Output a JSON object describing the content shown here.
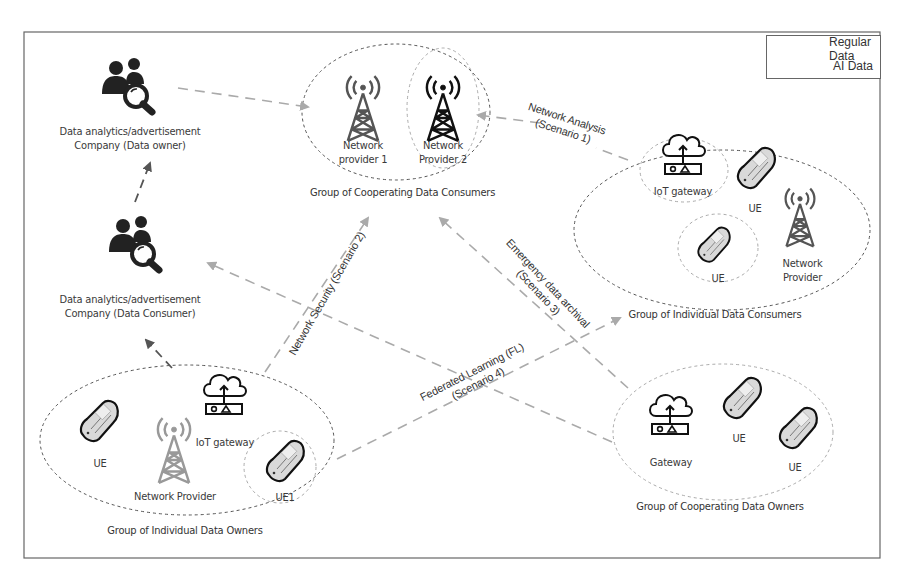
{
  "legend": {
    "items": [
      {
        "label": "Regular Data",
        "color": "#555555"
      },
      {
        "label": "AI Data",
        "color": "#aaaaaa"
      }
    ]
  },
  "nodes": {
    "company_owner": {
      "line1": "Data analytics/advertisement",
      "line2": "Company  (Data owner)",
      "icon": "people-search-icon"
    },
    "company_consumer": {
      "line1": "Data analytics/advertisement",
      "line2": "Company  (Data Consumer)",
      "icon": "people-search-icon"
    },
    "cooperating_consumers": {
      "group_label": "Group of Cooperating Data Consumers",
      "provider1": {
        "line1": "Network",
        "line2": "provider 1"
      },
      "provider2": {
        "line1": "Network",
        "line2": "Provider 2"
      }
    },
    "individual_consumers": {
      "group_label": "Group of Individual Data Consumers",
      "gateway": "IoT gateway",
      "ue1": "UE",
      "ue2": "UE",
      "provider": {
        "line1": "Network",
        "line2": "Provider"
      }
    },
    "individual_owners": {
      "group_label": "Group of Individual Data Owners",
      "ue": "UE",
      "provider": "Network Provider",
      "gateway": "IoT gateway",
      "ue1": "UE1"
    },
    "cooperating_owners": {
      "group_label": "Group of Cooperating Data Owners",
      "gateway": "Gateway",
      "ue1": "UE",
      "ue2": "UE"
    }
  },
  "scenarios": {
    "s1": {
      "line1": "Network Analysis",
      "line2": "(Scenario 1)"
    },
    "s2": {
      "line1": "Network Security (Scenario 2)"
    },
    "s3": {
      "line1": "Emergency data archival",
      "line2": "(Scenario 3)"
    },
    "s4": {
      "line1": "Federated Learning (FL)",
      "line2": "(Scenario 4)"
    }
  }
}
